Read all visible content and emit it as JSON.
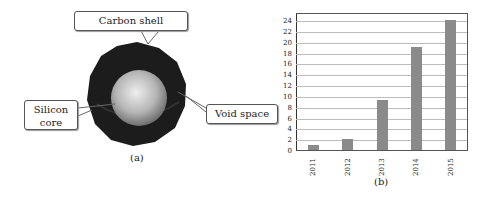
{
  "panel_a": {
    "caption": "(a)",
    "labels": {
      "carbon_shell": "Carbon shell",
      "silicon_core_line1": "Silicon",
      "silicon_core_line2": "core",
      "void_space": "Void space"
    },
    "colors": {
      "shell": "#1c1c1c",
      "core_light": "#e6e6e6",
      "core_dark": "#7a7a7a"
    }
  },
  "panel_b": {
    "caption": "(b)"
  },
  "chart_data": {
    "type": "bar",
    "title": "",
    "xlabel": "",
    "ylabel": "",
    "categories": [
      "2011",
      "2012",
      "2013",
      "2014",
      "2015"
    ],
    "values": [
      1,
      2,
      9.2,
      19,
      24
    ],
    "ylim": [
      0,
      25
    ],
    "yticks": [
      "0",
      "2",
      "4",
      "6",
      "8",
      "10",
      "12",
      "14",
      "16",
      "18",
      "20",
      "22",
      "24"
    ],
    "grid": true,
    "bar_color": "#8a8a8a"
  }
}
